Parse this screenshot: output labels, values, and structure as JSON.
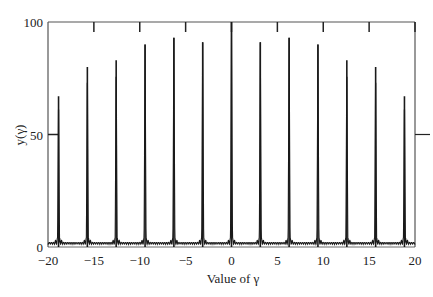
{
  "chart_data": {
    "type": "line",
    "title": "",
    "xlabel": "Value of γ",
    "ylabel": "y(γ)",
    "xlim": [
      -20,
      20
    ],
    "ylim": [
      0,
      100
    ],
    "grid": false,
    "legend": "none",
    "x_ticks": [
      -20,
      -15,
      -10,
      -5,
      0,
      5,
      10,
      15,
      20
    ],
    "x_tick_labels": [
      "−20",
      "−15",
      "−10",
      "−5",
      "0",
      "5",
      "10",
      "15",
      "20"
    ],
    "y_ticks": [
      0,
      50,
      100
    ],
    "y_tick_labels": [
      "0",
      "50",
      "100"
    ],
    "series": [
      {
        "name": "y(γ)",
        "peaks": [
          {
            "x": -18.85,
            "y": 67
          },
          {
            "x": -15.71,
            "y": 80
          },
          {
            "x": -12.57,
            "y": 83
          },
          {
            "x": -9.42,
            "y": 90
          },
          {
            "x": -6.28,
            "y": 93
          },
          {
            "x": -3.14,
            "y": 91
          },
          {
            "x": 0,
            "y": 100
          },
          {
            "x": 3.14,
            "y": 91
          },
          {
            "x": 6.28,
            "y": 93
          },
          {
            "x": 9.42,
            "y": 90
          },
          {
            "x": 12.57,
            "y": 83
          },
          {
            "x": 15.71,
            "y": 80
          },
          {
            "x": 18.85,
            "y": 67
          }
        ],
        "baseline_ripple_max": 5
      }
    ]
  }
}
